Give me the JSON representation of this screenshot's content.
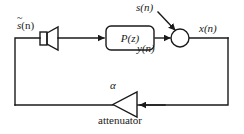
{
  "diagram": {
    "stroke_color": "#1a1a1a",
    "fill_color": "#ffffff",
    "labels": {
      "source_signal": "s(n)",
      "source_signal_base": "s",
      "source_signal_tilde": "~",
      "source_signal_arg": "(n)",
      "noise_input": "s(n)",
      "filter_output": "y(n)",
      "mic_signal": "x(n)",
      "gain": "α",
      "attenuator": "attenuator"
    },
    "nodes": {
      "loudspeaker": "loudspeaker",
      "filter_block": "P(z)",
      "summing_junction": "summing-junction",
      "attenuator_triangle": "attenuator"
    }
  }
}
